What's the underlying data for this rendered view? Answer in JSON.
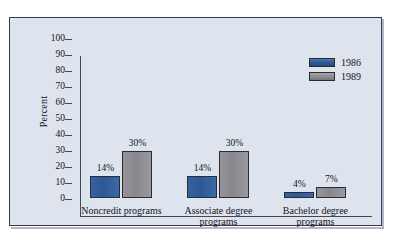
{
  "chart_data": {
    "type": "bar",
    "title": "",
    "subtitle": "",
    "xlabel": "",
    "ylabel": "Percent",
    "ylim": [
      0,
      100
    ],
    "ytick_labels": [
      "100",
      "90",
      "80",
      "70",
      "60",
      "50",
      "40",
      "30",
      "20",
      "10",
      "0"
    ],
    "ytick_values": [
      100,
      90,
      80,
      70,
      60,
      50,
      40,
      30,
      20,
      10,
      0
    ],
    "grid": false,
    "legend_position": "top-right",
    "categories": [
      "Noncredit programs",
      "Associate degree programs",
      "Bachelor degree programs"
    ],
    "category_lines": [
      [
        "Noncredit programs"
      ],
      [
        "Associate degree",
        "programs"
      ],
      [
        "Bachelor degree",
        "programs"
      ]
    ],
    "series": [
      {
        "name": "1986",
        "color": "#2d5896",
        "values": [
          14,
          14,
          4
        ],
        "labels": [
          "14%",
          "14%",
          "4%"
        ]
      },
      {
        "name": "1989",
        "color": "#8a8a90",
        "values": [
          30,
          30,
          7
        ],
        "labels": [
          "30%",
          "30%",
          "7%"
        ]
      }
    ]
  },
  "legend": {
    "entries": [
      {
        "label": "1986",
        "swatch": "blue"
      },
      {
        "label": "1989",
        "swatch": "gray"
      }
    ]
  },
  "colors": {
    "panel_background": "#dde4ee",
    "panel_border": "#3a3a48",
    "series_1986": "#2d5896",
    "series_1989": "#8a8a90",
    "axis": "#474752",
    "text": "#15151c"
  }
}
